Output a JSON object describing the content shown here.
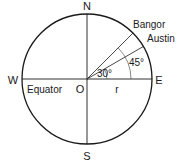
{
  "diagram": {
    "labels": {
      "north": "N",
      "south": "S",
      "west": "W",
      "east": "E",
      "origin": "O",
      "equator": "Equator",
      "radius": "r",
      "bangor": "Bangor",
      "austin": "Austin",
      "angle_austin": "30°",
      "angle_bangor": "45°"
    },
    "colors": {
      "stroke": "#1a1a1a",
      "background": "#ffffff"
    }
  }
}
